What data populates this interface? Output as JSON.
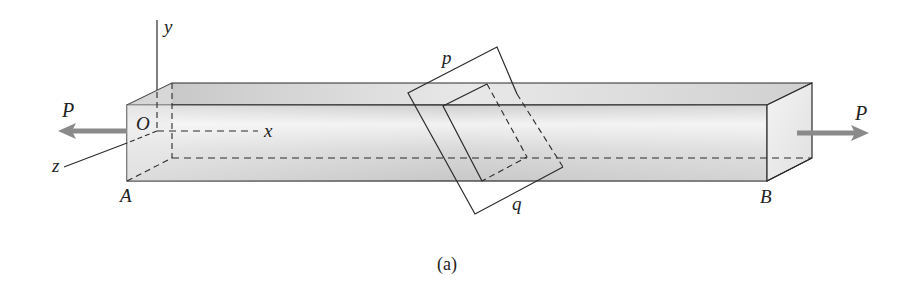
{
  "figure": {
    "caption": "(a)",
    "labels": {
      "load_left": "P",
      "load_right": "P",
      "origin": "O",
      "axis_x": "x",
      "axis_y": "y",
      "axis_z": "z",
      "end_left": "A",
      "end_right": "B",
      "plane_top": "p",
      "plane_bottom": "q"
    },
    "colors": {
      "bar_face": "#d6d6d6",
      "bar_top": "#e2e2e2",
      "bar_end": "#ebebeb",
      "edge": "#2a2a2a",
      "arrow": "#808080"
    }
  }
}
